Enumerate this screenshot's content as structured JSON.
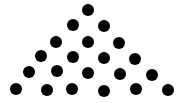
{
  "figure": {
    "rows": 6,
    "dots_per_row": [
      1,
      2,
      3,
      4,
      5,
      6
    ],
    "total_dots": 21,
    "dot_color": "#000000",
    "background_color": "#ffffff"
  }
}
